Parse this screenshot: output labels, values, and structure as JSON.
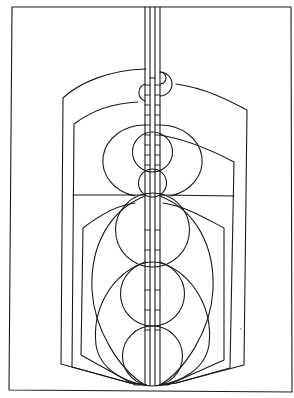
{
  "artwork": {
    "kind": "geometric line drawing",
    "width": 294,
    "height": 398,
    "background": "#ffffff",
    "line_color": "#1a1a1a",
    "elements": [
      "outer-frame",
      "central-double-column",
      "outer-shield-outline",
      "middle-shield-outline",
      "inner-hexagon-outline",
      "top-small-circles",
      "upper-circle-stack",
      "lower-large-circle-stack",
      "horizontal-divider"
    ]
  }
}
